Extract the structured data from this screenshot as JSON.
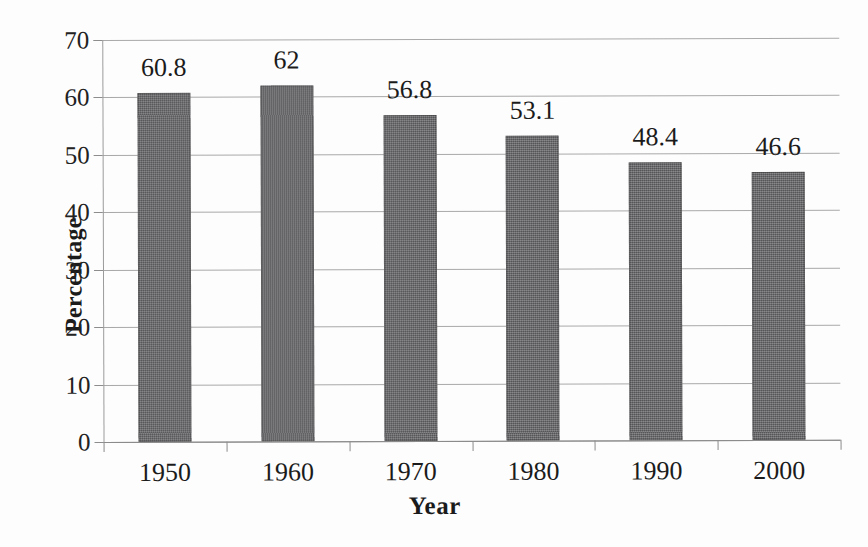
{
  "chart_data": {
    "type": "bar",
    "title": "",
    "xlabel": "Year",
    "ylabel": "Percentage",
    "categories": [
      "1950",
      "1960",
      "1970",
      "1980",
      "1990",
      "2000"
    ],
    "values": [
      60.8,
      62,
      56.8,
      53.1,
      48.4,
      46.6
    ],
    "value_labels": [
      "60.8",
      "62",
      "56.8",
      "53.1",
      "48.4",
      "46.6"
    ],
    "ylim": [
      0,
      70
    ],
    "ytick_step": 10,
    "ytick_labels": [
      "0",
      "10",
      "20",
      "30",
      "40",
      "50",
      "60",
      "70"
    ],
    "grid": "horizontal",
    "legend": "none",
    "bar_color": "#67676a",
    "gridline_color": "#a9a9a9",
    "axis_color": "#8b8b8b",
    "text_color": "#1b1b1b",
    "background": "#fdfdfd"
  }
}
